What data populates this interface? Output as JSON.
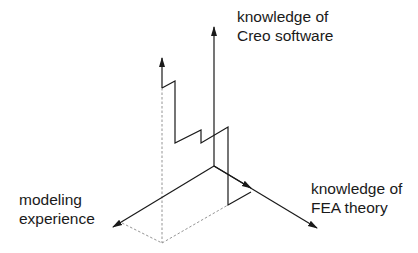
{
  "diagram": {
    "type": "3d-axes-staircase",
    "axes": {
      "vertical": {
        "label_line1": "knowledge of",
        "label_line2": "Creo software"
      },
      "left": {
        "label_line1": "modeling",
        "label_line2": "experience"
      },
      "right": {
        "label_line1": "knowledge of",
        "label_line2": "FEA theory"
      }
    },
    "colors": {
      "line": "#1a1a1a",
      "dashed": "#777777",
      "background": "#ffffff"
    }
  }
}
